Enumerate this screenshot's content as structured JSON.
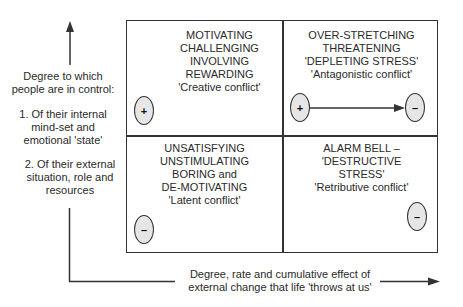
{
  "y_axis": {
    "title_line1": "Degree to which",
    "title_line2": "people are in control:",
    "item1_line1": "1. Of their internal",
    "item1_line2": "mind-set and",
    "item1_line3": "emotional 'state'",
    "item2_line1": "2. Of their external",
    "item2_line2": "situation, role and",
    "item2_line3": "resources"
  },
  "x_axis": {
    "line1": "Degree, rate and cumulative effect of",
    "line2": "external change that life 'throws at us'"
  },
  "quadrants": {
    "top_left": {
      "lines": [
        "MOTIVATING",
        "CHALLENGING",
        "INVOLVING",
        "REWARDING",
        "'Creative conflict'"
      ],
      "marker": "+"
    },
    "top_right": {
      "lines": [
        "OVER-STRETCHING",
        "THREATENING",
        "'DEPLETING STRESS'",
        "'Antagonistic conflict'"
      ],
      "marker_start": "+",
      "marker_end": "–"
    },
    "bottom_left": {
      "lines": [
        "UNSATISFYING",
        "UNSTIMULATING",
        "BORING and",
        "DE-MOTIVATING",
        "'Latent conflict'"
      ],
      "marker": "–"
    },
    "bottom_right": {
      "lines": [
        "ALARM BELL –",
        "'DESTRUCTIVE",
        "STRESS'",
        "'Retributive conflict'"
      ],
      "marker": "–"
    }
  },
  "colors": {
    "line": "#333333",
    "oval_fill": "#e6e6e6",
    "text": "#2a2a2a"
  }
}
